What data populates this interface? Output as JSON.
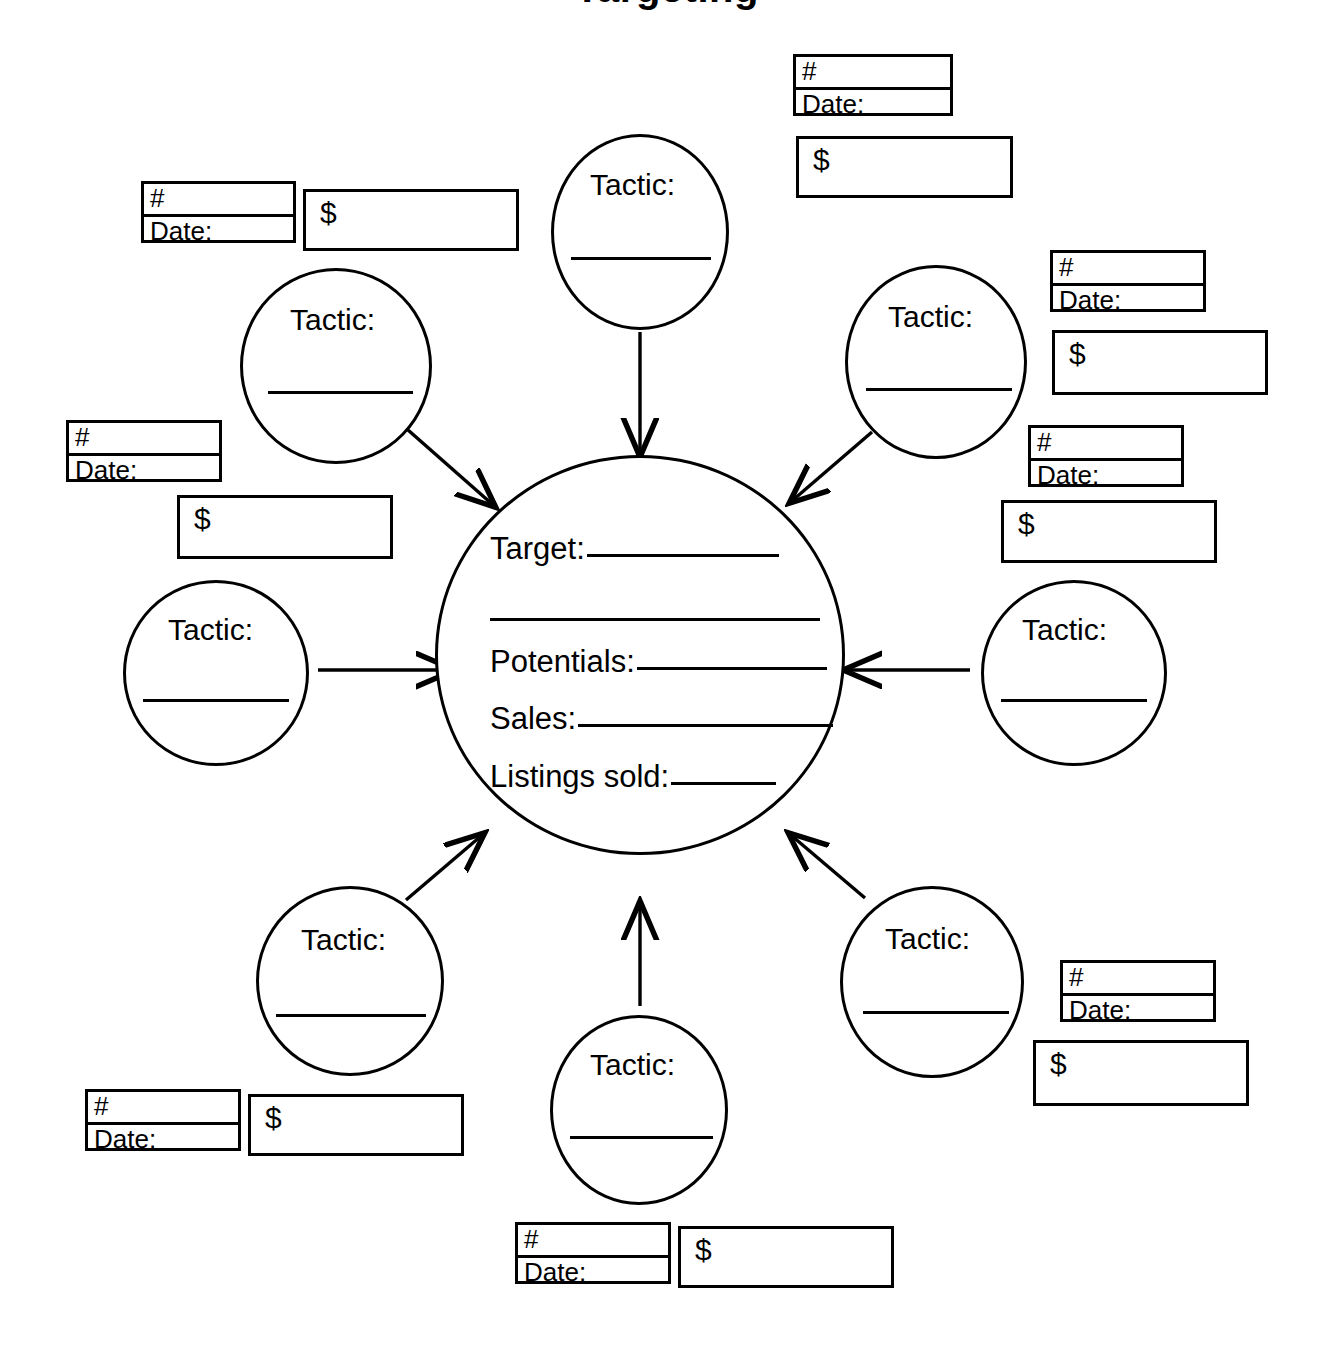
{
  "document": {
    "title": "Targeting",
    "center": {
      "name": "target-circle",
      "lines": [
        {
          "label": "Target:",
          "value": ""
        },
        {
          "label": "",
          "value": ""
        },
        {
          "label": "Potentials:",
          "value": ""
        },
        {
          "label": "Sales:",
          "value": ""
        },
        {
          "label": "Listings sold:",
          "value": ""
        }
      ]
    },
    "tactic_label": "Tactic:",
    "tactics": [
      {
        "id": "tactic-top",
        "label": "Tactic:"
      },
      {
        "id": "tactic-top-left",
        "label": "Tactic:"
      },
      {
        "id": "tactic-left",
        "label": "Tactic:"
      },
      {
        "id": "tactic-bottom-left",
        "label": "Tactic:"
      },
      {
        "id": "tactic-bottom",
        "label": "Tactic:"
      },
      {
        "id": "tactic-bottom-right",
        "label": "Tactic:"
      },
      {
        "id": "tactic-right",
        "label": "Tactic:"
      },
      {
        "id": "tactic-top-right",
        "label": "Tactic:"
      }
    ],
    "annotation_labels": {
      "count": "#",
      "date": "Date:",
      "amount": "$"
    },
    "annotations": [
      {
        "id": "annotation-top-right",
        "count": "#",
        "date": "Date:",
        "amount": "$"
      },
      {
        "id": "annotation-top-left",
        "count": "#",
        "date": "Date:",
        "amount": "$"
      },
      {
        "id": "annotation-left-upper",
        "count": "#",
        "date": "Date:",
        "amount": "$"
      },
      {
        "id": "annotation-right-upper",
        "count": "#",
        "date": "Date:",
        "amount": "$"
      },
      {
        "id": "annotation-right-middle",
        "count": "#",
        "date": "Date:",
        "amount": "$"
      },
      {
        "id": "annotation-right-lower",
        "count": "#",
        "date": "Date:",
        "amount": "$"
      },
      {
        "id": "annotation-bottom-left",
        "count": "#",
        "date": "Date:",
        "amount": "$"
      },
      {
        "id": "annotation-bottom",
        "count": "#",
        "date": "Date:",
        "amount": "$"
      }
    ],
    "colors": {
      "ink": "#000000",
      "paper": "#ffffff"
    }
  }
}
